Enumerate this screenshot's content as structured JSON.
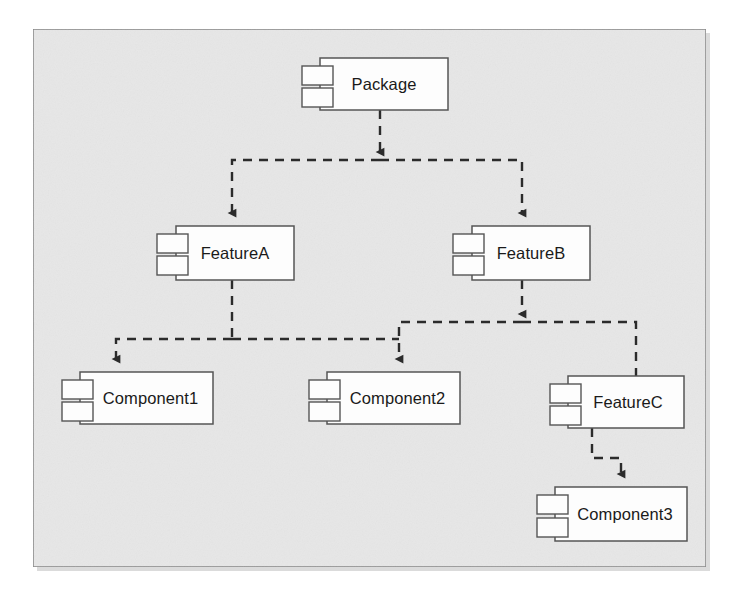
{
  "diagram": {
    "type": "uml-component-diagram",
    "title": "",
    "frame": {
      "x": 33,
      "y": 29,
      "width": 673,
      "height": 538,
      "fill": "#e7e7e7",
      "stroke": "#8a8a8a",
      "shadow": "#b8b8b8"
    },
    "style": {
      "node_fill": "#fdfdfd",
      "node_stroke": "#555555",
      "connector_color": "#2b2b2b",
      "connector_style": "dashed",
      "arrowhead": "filled-triangle",
      "text_color": "#1a1a1a"
    },
    "nodes": [
      {
        "id": "package",
        "label": "Package",
        "x": 320,
        "y": 58,
        "width": 128,
        "height": 52,
        "icon": "uml-component-icon"
      },
      {
        "id": "featureA",
        "label": "FeatureA",
        "x": 176,
        "y": 226,
        "width": 118,
        "height": 54,
        "icon": "uml-component-icon"
      },
      {
        "id": "featureB",
        "label": "FeatureB",
        "x": 472,
        "y": 226,
        "width": 118,
        "height": 54,
        "icon": "uml-component-icon"
      },
      {
        "id": "component1",
        "label": "Component1",
        "x": 80,
        "y": 372,
        "width": 133,
        "height": 52,
        "icon": "uml-component-icon"
      },
      {
        "id": "component2",
        "label": "Component2",
        "x": 327,
        "y": 372,
        "width": 133,
        "height": 52,
        "icon": "uml-component-icon"
      },
      {
        "id": "featureC",
        "label": "FeatureC",
        "x": 568,
        "y": 376,
        "width": 116,
        "height": 52,
        "icon": "uml-component-icon"
      },
      {
        "id": "component3",
        "label": "Component3",
        "x": 555,
        "y": 487,
        "width": 132,
        "height": 54,
        "icon": "uml-component-icon"
      }
    ],
    "connectors": [
      {
        "id": "package-to-featureA",
        "from": "package",
        "to": "featureA",
        "style": "dashed",
        "arrow": "to"
      },
      {
        "id": "package-to-featureB",
        "from": "package",
        "to": "featureB",
        "style": "dashed",
        "arrow": "to"
      },
      {
        "id": "featureA-to-component1",
        "from": "featureA",
        "to": "component1",
        "style": "dashed",
        "arrow": "to"
      },
      {
        "id": "featureA-to-component2",
        "from": "featureA",
        "to": "component2",
        "style": "dashed",
        "arrow": "to"
      },
      {
        "id": "featureB-to-component2",
        "from": "featureB",
        "to": "component2",
        "style": "dashed",
        "arrow": "to"
      },
      {
        "id": "featureB-to-featureC",
        "from": "featureB",
        "to": "featureC",
        "style": "dashed",
        "arrow": "to"
      },
      {
        "id": "featureC-to-component3",
        "from": "featureC",
        "to": "component3",
        "style": "dashed",
        "arrow": "to"
      }
    ]
  }
}
